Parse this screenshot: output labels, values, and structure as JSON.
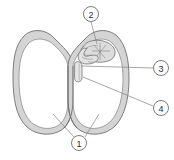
{
  "figure": {
    "background_color": "#ffffff",
    "outline_color": "#6e6e6e",
    "fill_color": "#d6d6d6",
    "inner_fill_color": "#ffffff",
    "leader_line_color": "#8a8a8a",
    "label_text_color": "#2b2b2b",
    "label_circle_stroke": "#6e6e6e"
  },
  "callouts": [
    {
      "id": "1",
      "number": "1",
      "name": "cotyledons",
      "cx": 79,
      "cy": 143,
      "r": 7.5
    },
    {
      "id": "2",
      "number": "2",
      "name": "seed-coat-testa",
      "cx": 91,
      "cy": 14,
      "r": 7.5
    },
    {
      "id": "3",
      "number": "3",
      "name": "plumule",
      "cx": 161,
      "cy": 68,
      "r": 7.5
    },
    {
      "id": "4",
      "number": "4",
      "name": "radicle",
      "cx": 161,
      "cy": 108,
      "r": 7.5
    }
  ],
  "parts": [
    {
      "id": "left-cotyledon",
      "label": "left cotyledon"
    },
    {
      "id": "right-cotyledon",
      "label": "right cotyledon"
    },
    {
      "id": "embryo",
      "label": "embryo"
    },
    {
      "id": "plumule",
      "label": "plumule"
    },
    {
      "id": "radicle",
      "label": "radicle"
    },
    {
      "id": "hilum-notch",
      "label": "hilum notch"
    }
  ],
  "leader_lines": [
    {
      "from": "1",
      "to": "left-cotyledon"
    },
    {
      "from": "1",
      "to": "right-cotyledon"
    },
    {
      "from": "2",
      "to": "seed-coat"
    },
    {
      "from": "3",
      "to": "plumule"
    },
    {
      "from": "4",
      "to": "radicle"
    }
  ]
}
